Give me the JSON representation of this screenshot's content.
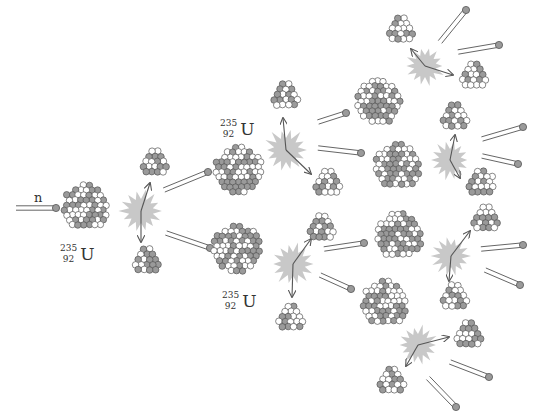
{
  "diagram": {
    "colors": {
      "background": "#ffffff",
      "nucleon_dark": "#9a9a9a",
      "nucleon_light": "#ffffff",
      "outline": "#555555",
      "flash": "#c8c8c8",
      "arrow": "#555555"
    },
    "neutron_label": "n",
    "isotope": {
      "mass": "235",
      "atomic": "92",
      "symbol": "U"
    },
    "labels": [
      {
        "id": "u-initial",
        "x": 60,
        "y": 243
      },
      {
        "id": "u-upper",
        "x": 220,
        "y": 118
      },
      {
        "id": "u-lower",
        "x": 222,
        "y": 290
      }
    ],
    "large_nuclei": [
      {
        "id": "u-initial",
        "cx": 86,
        "cy": 207,
        "r": 25
      },
      {
        "id": "u-upper",
        "cx": 239,
        "cy": 170,
        "r": 26
      },
      {
        "id": "u-lower",
        "cx": 237,
        "cy": 249,
        "r": 26
      },
      {
        "id": "u-g3-1",
        "cx": 379,
        "cy": 102,
        "r": 24
      },
      {
        "id": "u-g3-2",
        "cx": 398,
        "cy": 166,
        "r": 25
      },
      {
        "id": "u-g3-3",
        "cx": 400,
        "cy": 236,
        "r": 25
      },
      {
        "id": "u-g3-4",
        "cx": 385,
        "cy": 303,
        "r": 25
      }
    ],
    "fragments": [
      {
        "cx": 155,
        "cy": 163,
        "r": 15
      },
      {
        "cx": 147,
        "cy": 261,
        "r": 15
      },
      {
        "cx": 286,
        "cy": 96,
        "r": 15
      },
      {
        "cx": 328,
        "cy": 183,
        "r": 15
      },
      {
        "cx": 322,
        "cy": 228,
        "r": 15
      },
      {
        "cx": 291,
        "cy": 318,
        "r": 15
      },
      {
        "cx": 401,
        "cy": 30,
        "r": 15
      },
      {
        "cx": 474,
        "cy": 76,
        "r": 15
      },
      {
        "cx": 455,
        "cy": 117,
        "r": 15
      },
      {
        "cx": 481,
        "cy": 183,
        "r": 15
      },
      {
        "cx": 486,
        "cy": 219,
        "r": 15
      },
      {
        "cx": 455,
        "cy": 297,
        "r": 15
      },
      {
        "cx": 469,
        "cy": 335,
        "r": 15
      },
      {
        "cx": 392,
        "cy": 381,
        "r": 15
      }
    ],
    "flashes": [
      {
        "cx": 141,
        "cy": 211,
        "r": 22
      },
      {
        "cx": 286,
        "cy": 150,
        "r": 22
      },
      {
        "cx": 293,
        "cy": 264,
        "r": 22
      },
      {
        "cx": 425,
        "cy": 66,
        "r": 20
      },
      {
        "cx": 450,
        "cy": 160,
        "r": 20
      },
      {
        "cx": 451,
        "cy": 256,
        "r": 20
      },
      {
        "cx": 418,
        "cy": 345,
        "r": 20
      }
    ],
    "arrows": [
      {
        "x1": 141,
        "y1": 211,
        "x2": 150,
        "y2": 183
      },
      {
        "x1": 141,
        "y1": 211,
        "x2": 141,
        "y2": 242
      },
      {
        "x1": 286,
        "y1": 150,
        "x2": 283,
        "y2": 118
      },
      {
        "x1": 286,
        "y1": 150,
        "x2": 311,
        "y2": 174
      },
      {
        "x1": 293,
        "y1": 264,
        "x2": 311,
        "y2": 239
      },
      {
        "x1": 293,
        "y1": 264,
        "x2": 292,
        "y2": 297
      },
      {
        "x1": 425,
        "y1": 66,
        "x2": 411,
        "y2": 49
      },
      {
        "x1": 425,
        "y1": 66,
        "x2": 453,
        "y2": 75
      },
      {
        "x1": 450,
        "y1": 160,
        "x2": 455,
        "y2": 135
      },
      {
        "x1": 450,
        "y1": 160,
        "x2": 460,
        "y2": 178
      },
      {
        "x1": 451,
        "y1": 256,
        "x2": 470,
        "y2": 231
      },
      {
        "x1": 451,
        "y1": 256,
        "x2": 449,
        "y2": 281
      },
      {
        "x1": 418,
        "y1": 345,
        "x2": 449,
        "y2": 337
      },
      {
        "x1": 418,
        "y1": 345,
        "x2": 406,
        "y2": 366
      }
    ],
    "neutrons": [
      {
        "x1": 16,
        "y1": 208,
        "x2": 56,
        "y2": 208
      },
      {
        "x1": 164,
        "y1": 190,
        "x2": 208,
        "y2": 172
      },
      {
        "x1": 166,
        "y1": 233,
        "x2": 210,
        "y2": 248
      },
      {
        "x1": 318,
        "y1": 122,
        "x2": 346,
        "y2": 113
      },
      {
        "x1": 318,
        "y1": 148,
        "x2": 361,
        "y2": 153
      },
      {
        "x1": 324,
        "y1": 249,
        "x2": 364,
        "y2": 243
      },
      {
        "x1": 320,
        "y1": 275,
        "x2": 351,
        "y2": 289
      },
      {
        "x1": 440,
        "y1": 42,
        "x2": 466,
        "y2": 10
      },
      {
        "x1": 458,
        "y1": 52,
        "x2": 499,
        "y2": 45
      },
      {
        "x1": 482,
        "y1": 139,
        "x2": 523,
        "y2": 127
      },
      {
        "x1": 482,
        "y1": 156,
        "x2": 518,
        "y2": 164
      },
      {
        "x1": 481,
        "y1": 249,
        "x2": 523,
        "y2": 245
      },
      {
        "x1": 485,
        "y1": 270,
        "x2": 520,
        "y2": 285
      },
      {
        "x1": 450,
        "y1": 362,
        "x2": 489,
        "y2": 377
      },
      {
        "x1": 428,
        "y1": 378,
        "x2": 456,
        "y2": 407
      }
    ]
  }
}
